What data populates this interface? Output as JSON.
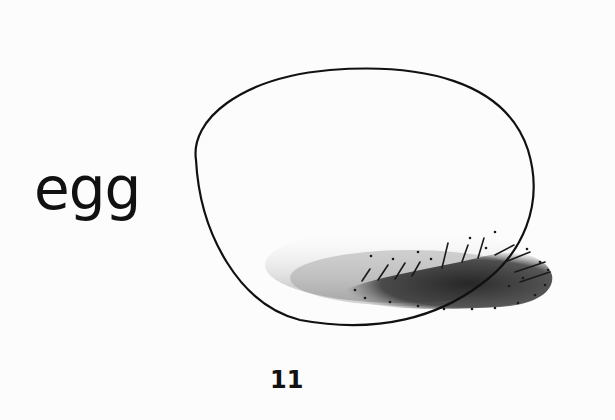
{
  "page": {
    "word": "egg",
    "page_number": "11",
    "illustration": "egg-drawing"
  },
  "colors": {
    "background": "#fcfcfc",
    "ink": "#111111",
    "shadow": "#2a2a2a"
  }
}
